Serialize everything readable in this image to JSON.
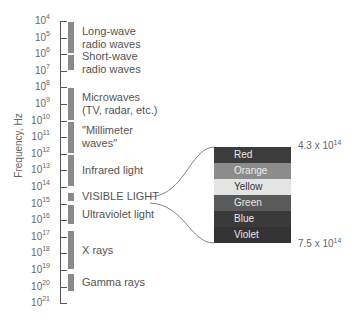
{
  "y_axis_title": "Frequency, Hz",
  "ticks": [
    {
      "base": "10",
      "exp": "4"
    },
    {
      "base": "10",
      "exp": "5"
    },
    {
      "base": "10",
      "exp": "6"
    },
    {
      "base": "10",
      "exp": "7"
    },
    {
      "base": "10",
      "exp": "8"
    },
    {
      "base": "10",
      "exp": "9"
    },
    {
      "base": "10",
      "exp": "10"
    },
    {
      "base": "10",
      "exp": "11"
    },
    {
      "base": "10",
      "exp": "12"
    },
    {
      "base": "10",
      "exp": "13"
    },
    {
      "base": "10",
      "exp": "14"
    },
    {
      "base": "10",
      "exp": "15"
    },
    {
      "base": "10",
      "exp": "16"
    },
    {
      "base": "10",
      "exp": "17"
    },
    {
      "base": "10",
      "exp": "18"
    },
    {
      "base": "10",
      "exp": "19"
    },
    {
      "base": "10",
      "exp": "20"
    },
    {
      "base": "10",
      "exp": "21"
    }
  ],
  "regions": [
    {
      "label": "Long-wave\nradio waves",
      "from": 4,
      "to": 6
    },
    {
      "label": "Short-wave\nradio waves",
      "from": 6,
      "to": 7
    },
    {
      "label": "Microwaves\n(TV, radar, etc.)",
      "from": 8,
      "to": 10
    },
    {
      "label": "\"Millimeter\n waves\"",
      "from": 10,
      "to": 12
    },
    {
      "label": "Infrared light",
      "from": 12,
      "to": 14
    },
    {
      "label": "VISIBLE LIGHT",
      "from": 14.3,
      "to": 14.9
    },
    {
      "label": "Ultraviolet light",
      "from": 15,
      "to": 16.3
    },
    {
      "label": "X rays",
      "from": 16.6,
      "to": 19
    },
    {
      "label": "Gamma rays",
      "from": 19.2,
      "to": 20.3
    }
  ],
  "visible_spectrum": {
    "bands": [
      {
        "label": "Red",
        "bg": "#3c3c3c",
        "fg": "#e8e8e8"
      },
      {
        "label": "Orange",
        "bg": "#8c8c8c",
        "fg": "#ececec"
      },
      {
        "label": "Yellow",
        "bg": "#e4e4e4",
        "fg": "#333333"
      },
      {
        "label": "Green",
        "bg": "#5a5a5a",
        "fg": "#e8e8e8"
      },
      {
        "label": "Blue",
        "bg": "#3a3a3a",
        "fg": "#e8e8e8"
      },
      {
        "label": "Violet",
        "bg": "#333333",
        "fg": "#e8e8e8"
      }
    ],
    "low_freq": {
      "mantissa": "4.3 x 10",
      "exp": "14"
    },
    "high_freq": {
      "mantissa": "7.5 x 10",
      "exp": "14"
    }
  }
}
